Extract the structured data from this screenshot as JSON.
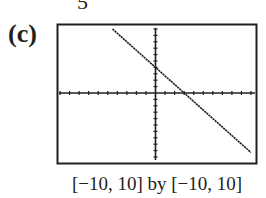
{
  "top_fragment": "5",
  "part_label": "(c)",
  "caption": "[−10, 10] by [−10, 10]",
  "colors": {
    "ink": "#231f20",
    "background": "#ffffff"
  },
  "chart_data": {
    "type": "line",
    "title": "",
    "xlabel": "",
    "ylabel": "",
    "xlim": [
      -10,
      10
    ],
    "ylim": [
      -10,
      10
    ],
    "xscl": 1,
    "yscl": 1,
    "grid": false,
    "axes_ticks": true,
    "window_caption": "[−10, 10] by [−10, 10]",
    "series": [
      {
        "name": "line",
        "equation_estimate": "y = -(4/3)x + 4",
        "x": [
          -4.5,
          -3,
          0,
          3,
          6,
          10
        ],
        "y": [
          10,
          8,
          4,
          0,
          -4,
          -9.3
        ]
      }
    ],
    "intercepts": {
      "x_intercept": 3,
      "y_intercept": 4
    }
  }
}
